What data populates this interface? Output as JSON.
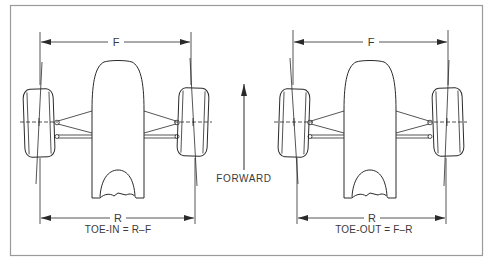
{
  "figure": {
    "frame_color": "#999999",
    "ink_color": "#2a2a2a",
    "center": {
      "forward_label": "FORWARD"
    },
    "left_panel": {
      "name": "toe-in",
      "front_dim_label": "F",
      "rear_dim_label": "R",
      "formula": "TOE-IN = R–F"
    },
    "right_panel": {
      "name": "toe-out",
      "front_dim_label": "F",
      "rear_dim_label": "R",
      "formula": "TOE-OUT = F–R"
    },
    "icons": {
      "forward_arrow": "arrow-up-icon",
      "dimension_arrow": "double-headed-arrow-icon"
    }
  }
}
